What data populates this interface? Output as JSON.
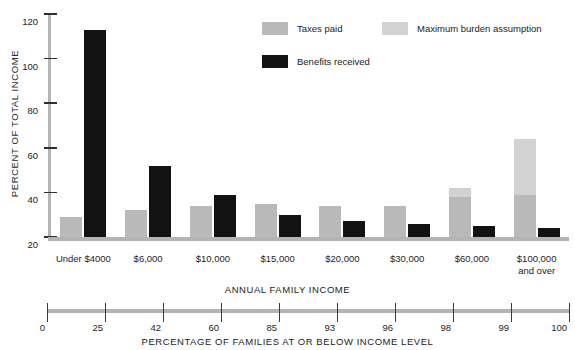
{
  "chart_data": {
    "type": "bar",
    "title": "",
    "xlabel": "ANNUAL FAMILY INCOME",
    "ylabel": "PERCENT OF TOTAL INCOME",
    "ylim": [
      20,
      120
    ],
    "yticks": [
      20,
      40,
      60,
      80,
      100,
      120
    ],
    "grid": false,
    "legend_position": "top-right",
    "categories": [
      "Under $4000",
      "$6,000",
      "$10,000",
      "$15,000",
      "$20,000",
      "$30,000",
      "$60,000",
      "$100,000 and over"
    ],
    "series": [
      {
        "name": "Taxes paid",
        "color": "#b9b9b9",
        "values": [
          29,
          32,
          34,
          35,
          34,
          34,
          38,
          39
        ]
      },
      {
        "name": "Maximum burden assumption",
        "color": "#d2d2d2",
        "values": [
          null,
          null,
          null,
          null,
          null,
          null,
          42,
          64
        ]
      },
      {
        "name": "Benefits received",
        "color": "#121212",
        "values": [
          113,
          52,
          39,
          30,
          27,
          26,
          25,
          24
        ]
      }
    ],
    "secondary_axis": {
      "label": "PERCENTAGE OF FAMILIES AT OR BELOW INCOME LEVEL",
      "ticks": [
        0,
        25,
        42,
        60,
        85,
        93,
        96,
        98,
        99,
        100
      ]
    }
  },
  "legend": {
    "items": [
      {
        "label": "Taxes paid",
        "swatch": "taxes"
      },
      {
        "label": "Maximum burden assumption",
        "swatch": "maxburden"
      },
      {
        "label": "Benefits received",
        "swatch": "benefits"
      }
    ]
  },
  "category_lines": [
    [
      "Under $4000"
    ],
    [
      "$6,000"
    ],
    [
      "$10,000"
    ],
    [
      "$15,000"
    ],
    [
      "$20,000"
    ],
    [
      "$30,000"
    ],
    [
      "$60,000"
    ],
    [
      "$100,000",
      "and over"
    ]
  ]
}
